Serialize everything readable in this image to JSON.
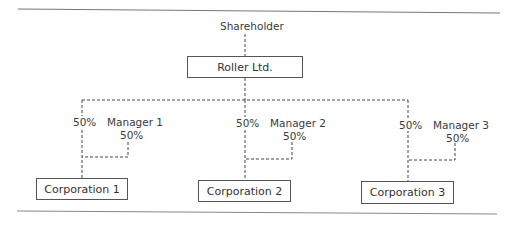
{
  "diagram": {
    "type": "ownership-structure",
    "top": {
      "label": "Shareholder"
    },
    "parent": {
      "label": "Roller Ltd."
    },
    "branches": [
      {
        "parent_share": "50%",
        "manager": "Manager 1",
        "manager_share": "50%",
        "subsidiary": "Corporation 1"
      },
      {
        "parent_share": "50%",
        "manager": "Manager 2",
        "manager_share": "50%",
        "subsidiary": "Corporation 2"
      },
      {
        "parent_share": "50%",
        "manager": "Manager 3",
        "manager_share": "50%",
        "subsidiary": "Corporation 3"
      }
    ]
  },
  "colors": {
    "line": "#444444",
    "rule": "#777777",
    "text": "#3a3a3a",
    "background": "#ffffff"
  }
}
